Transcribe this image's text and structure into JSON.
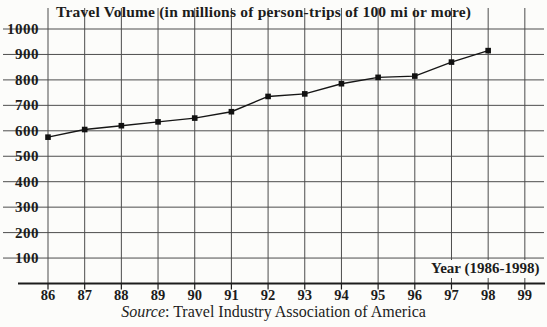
{
  "chart": {
    "title": "Travel Volume (in millions of person-trips of 100 mi or more)",
    "x_axis_label": "Year (1986-1998)",
    "source_prefix": "Source",
    "source_rest": ": Travel Industry Association of America"
  },
  "chart_data": {
    "type": "line",
    "title": "Travel Volume (in millions of person-trips of 100 mi or more)",
    "x_tick_labels": [
      "86",
      "87",
      "88",
      "89",
      "90",
      "91",
      "92",
      "93",
      "94",
      "95",
      "96",
      "97",
      "98",
      "99"
    ],
    "categories": [
      1986,
      1987,
      1988,
      1989,
      1990,
      1991,
      1992,
      1993,
      1994,
      1995,
      1996,
      1997,
      1998
    ],
    "series": [
      {
        "name": "Travel volume (millions of person-trips)",
        "values": [
          575,
          605,
          620,
          635,
          650,
          675,
          735,
          745,
          785,
          810,
          815,
          870,
          915
        ]
      }
    ],
    "xlabel": "Year (1986-1998)",
    "ylabel": "",
    "ylim": [
      0,
      1000
    ],
    "yticks": [
      100,
      200,
      300,
      400,
      500,
      600,
      700,
      800,
      900,
      1000
    ],
    "grid": true,
    "legend": "none",
    "annotations": [
      "Source: Travel Industry Association of America"
    ],
    "colors": {
      "ink": "#1c1c1c",
      "grid": "#4d4d4d",
      "line": "#161616",
      "marker": "#111111",
      "background": "#fcfcfa"
    }
  }
}
